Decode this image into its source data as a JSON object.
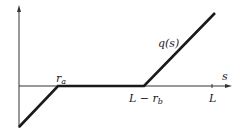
{
  "diagram": {
    "type": "piecewise-linear-function-plot",
    "function_label": "q(s)",
    "x_axis_label": "s",
    "tick_labels": {
      "r_a": {
        "main": "r",
        "sub": "a"
      },
      "L_minus_r_b": {
        "main": "L − r",
        "sub": "b"
      },
      "L": "L"
    },
    "segments": [
      {
        "description": "rising from negative value at s=0 to zero at r_a"
      },
      {
        "description": "zero between r_a and L − r_b"
      },
      {
        "description": "rising from zero at L − r_b upward past L"
      }
    ],
    "colors": {
      "line": "#1a1a1a",
      "axis": "#333333",
      "background": "#ffffff"
    }
  }
}
